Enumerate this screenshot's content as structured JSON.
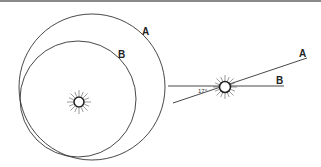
{
  "diagram": {
    "left_view": {
      "orbit_a_label": "A",
      "orbit_b_label": "B",
      "central_body": "sun-icon"
    },
    "right_view": {
      "line_a_label": "A",
      "line_b_label": "B",
      "angle_label": "17°",
      "central_body": "sun-icon"
    },
    "colors": {
      "stroke": "#333333",
      "top_border": "#8a8a8a"
    }
  }
}
